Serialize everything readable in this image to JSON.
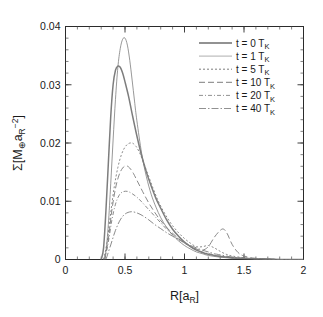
{
  "chart_data": {
    "type": "line",
    "title": "",
    "xlabel": "R[a_R]",
    "ylabel": "Σ[M⊕a_R⁻²]",
    "xlim": [
      0,
      2
    ],
    "ylim": [
      0,
      0.04
    ],
    "grid": false,
    "legend_position": "top-right",
    "xticks": [
      "0",
      "0.5",
      "1",
      "1.5",
      "2"
    ],
    "xtick_values": [
      0,
      0.5,
      1,
      1.5,
      2
    ],
    "yticks": [
      "0",
      "0.01",
      "0.02",
      "0.03",
      "0.04"
    ],
    "ytick_values": [
      0,
      0.01,
      0.02,
      0.03,
      0.04
    ],
    "x_minor_step": 0.1,
    "y_minor_step": 0.002,
    "series": [
      {
        "name": "t = 0 T_K",
        "label_main": "t = 0 T",
        "label_sub": "K",
        "style": "solid-thick",
        "dash": "none",
        "width": 1.5,
        "color": "#6e6e6e",
        "x": [
          0.3,
          0.32,
          0.34,
          0.36,
          0.38,
          0.4,
          0.42,
          0.44,
          0.46,
          0.48,
          0.5,
          0.53,
          0.56,
          0.6,
          0.64,
          0.68,
          0.72,
          0.76,
          0.8,
          0.85,
          0.9,
          0.95,
          1.0,
          1.05,
          1.1,
          1.15,
          1.2,
          1.25,
          1.3,
          1.4,
          1.5,
          1.6,
          1.7,
          1.8,
          1.9,
          2.0
        ],
        "y": [
          0.0,
          0.002,
          0.0085,
          0.0165,
          0.0245,
          0.03,
          0.0325,
          0.0332,
          0.033,
          0.032,
          0.0305,
          0.028,
          0.025,
          0.0212,
          0.0178,
          0.015,
          0.0126,
          0.0105,
          0.0088,
          0.0068,
          0.0052,
          0.004,
          0.003,
          0.0022,
          0.0016,
          0.0012,
          0.0009,
          0.0007,
          0.0005,
          0.0003,
          0.0002,
          0.0001,
          0.0001,
          0.0,
          0.0,
          0.0
        ]
      },
      {
        "name": "t = 1 T_K",
        "label_main": "t = 1 T",
        "label_sub": "K",
        "style": "solid-thin",
        "dash": "none",
        "width": 0.8,
        "color": "#9a9a9a",
        "x": [
          0.32,
          0.34,
          0.36,
          0.38,
          0.4,
          0.42,
          0.44,
          0.46,
          0.48,
          0.5,
          0.52,
          0.54,
          0.56,
          0.58,
          0.6,
          0.64,
          0.68,
          0.72,
          0.76,
          0.8,
          0.85,
          0.9,
          0.95,
          1.0,
          1.05,
          1.1,
          1.15,
          1.2,
          1.3,
          1.4,
          1.5,
          1.6,
          1.8,
          2.0
        ],
        "y": [
          0.0,
          0.0015,
          0.006,
          0.013,
          0.0205,
          0.0275,
          0.033,
          0.0362,
          0.0378,
          0.038,
          0.0368,
          0.0342,
          0.0308,
          0.0272,
          0.0238,
          0.0182,
          0.0142,
          0.0112,
          0.009,
          0.0072,
          0.0055,
          0.0042,
          0.0032,
          0.0024,
          0.0018,
          0.0013,
          0.001,
          0.0007,
          0.0004,
          0.0002,
          0.0001,
          0.0001,
          0.0,
          0.0
        ]
      },
      {
        "name": "t = 5 T_K",
        "label_main": "t = 5 T",
        "label_sub": "K",
        "style": "dotted",
        "dash": "2,2",
        "width": 0.9,
        "color": "#6e6e6e",
        "x": [
          0.32,
          0.35,
          0.38,
          0.41,
          0.44,
          0.47,
          0.5,
          0.53,
          0.56,
          0.58,
          0.6,
          0.63,
          0.66,
          0.7,
          0.74,
          0.78,
          0.82,
          0.86,
          0.9,
          0.95,
          1.0,
          1.05,
          1.1,
          1.15,
          1.2,
          1.25,
          1.3,
          1.35,
          1.4,
          1.5,
          1.6,
          1.8,
          2.0
        ],
        "y": [
          0.0,
          0.003,
          0.008,
          0.0125,
          0.0158,
          0.018,
          0.0193,
          0.0199,
          0.02,
          0.0197,
          0.0192,
          0.018,
          0.0164,
          0.0142,
          0.012,
          0.01,
          0.0084,
          0.007,
          0.0058,
          0.0046,
          0.0036,
          0.0028,
          0.0022,
          0.0022,
          0.0024,
          0.002,
          0.0014,
          0.0009,
          0.0006,
          0.0003,
          0.0001,
          0.0,
          0.0
        ]
      },
      {
        "name": "t = 10 T_K",
        "label_main": "t = 10 T",
        "label_sub": "K",
        "style": "dashed-long",
        "dash": "6,3",
        "width": 0.9,
        "color": "#6e6e6e",
        "x": [
          0.33,
          0.36,
          0.39,
          0.42,
          0.45,
          0.48,
          0.51,
          0.54,
          0.57,
          0.6,
          0.63,
          0.66,
          0.7,
          0.74,
          0.78,
          0.82,
          0.86,
          0.9,
          0.95,
          1.0,
          1.05,
          1.1,
          1.15,
          1.2,
          1.25,
          1.3,
          1.33,
          1.36,
          1.4,
          1.45,
          1.5,
          1.6,
          1.8,
          2.0
        ],
        "y": [
          0.0,
          0.0035,
          0.0085,
          0.0122,
          0.0145,
          0.0157,
          0.0161,
          0.0157,
          0.0148,
          0.0136,
          0.0124,
          0.0112,
          0.0097,
          0.0084,
          0.0072,
          0.0062,
          0.0053,
          0.0045,
          0.0036,
          0.0029,
          0.0023,
          0.0018,
          0.0016,
          0.0022,
          0.0038,
          0.005,
          0.0052,
          0.0044,
          0.0026,
          0.0012,
          0.0006,
          0.0002,
          0.0,
          0.0
        ]
      },
      {
        "name": "t = 20 T_K",
        "label_main": "t = 20 T",
        "label_sub": "K",
        "style": "dash-dot-small",
        "dash": "4,2,1,2",
        "width": 0.9,
        "color": "#858585",
        "x": [
          0.33,
          0.36,
          0.39,
          0.42,
          0.45,
          0.48,
          0.52,
          0.56,
          0.6,
          0.64,
          0.68,
          0.72,
          0.76,
          0.8,
          0.85,
          0.9,
          0.95,
          1.0,
          1.05,
          1.1,
          1.15,
          1.2,
          1.25,
          1.3,
          1.4,
          1.5,
          1.6,
          1.8,
          2.0
        ],
        "y": [
          0.0,
          0.003,
          0.0068,
          0.0095,
          0.011,
          0.0116,
          0.0117,
          0.0113,
          0.0107,
          0.0099,
          0.009,
          0.0081,
          0.0072,
          0.0063,
          0.0052,
          0.0043,
          0.0035,
          0.0028,
          0.0022,
          0.0017,
          0.0013,
          0.001,
          0.0008,
          0.0006,
          0.0003,
          0.0002,
          0.0001,
          0.0,
          0.0
        ]
      },
      {
        "name": "t = 40 T_K",
        "label_main": "t = 40 T",
        "label_sub": "K",
        "style": "dash-dot-long",
        "dash": "7,2,1.5,2",
        "width": 0.9,
        "color": "#858585",
        "x": [
          0.34,
          0.38,
          0.42,
          0.46,
          0.5,
          0.55,
          0.6,
          0.65,
          0.7,
          0.75,
          0.8,
          0.85,
          0.9,
          0.95,
          1.0,
          1.05,
          1.1,
          1.15,
          1.2,
          1.25,
          1.3,
          1.4,
          1.5,
          1.6,
          1.8,
          2.0
        ],
        "y": [
          0.0,
          0.0025,
          0.005,
          0.0068,
          0.0078,
          0.0082,
          0.008,
          0.0075,
          0.0068,
          0.006,
          0.0053,
          0.0046,
          0.004,
          0.0034,
          0.0029,
          0.0024,
          0.002,
          0.0016,
          0.0013,
          0.001,
          0.0008,
          0.0004,
          0.0002,
          0.0001,
          0.0,
          0.0
        ]
      }
    ]
  }
}
